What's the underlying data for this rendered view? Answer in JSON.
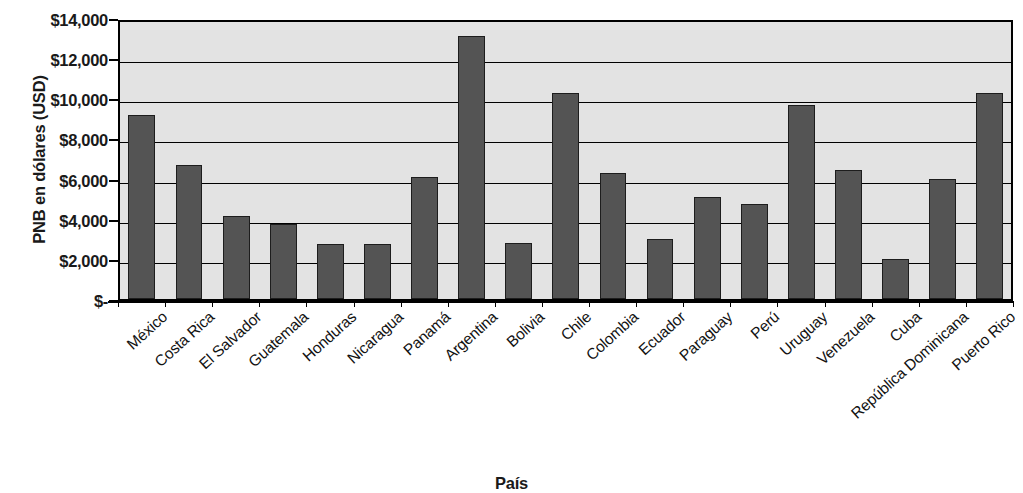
{
  "chart_data": {
    "type": "bar",
    "title": "",
    "xlabel": "País",
    "ylabel": "PNB en dólares (USD)",
    "ylim": [
      0,
      14000
    ],
    "ytick_values": [
      14000,
      12000,
      10000,
      8000,
      6000,
      4000,
      2000,
      0
    ],
    "ytick_labels": [
      "$14,000",
      "$12,000",
      "$10,000",
      "$8,000",
      "$6,000",
      "$4,000",
      "$2,000",
      "$-"
    ],
    "grid": true,
    "legend": "none",
    "bar_color": "#545454",
    "plot_background": "#e3e3e3",
    "categories": [
      "México",
      "Costa Rica",
      "El Salvador",
      "Guatemala",
      "Honduras",
      "Nicaragua",
      "Panamá",
      "Argentina",
      "Bolivia",
      "Chile",
      "Colombia",
      "Ecuador",
      "Paraguay",
      "Perú",
      "Uruguay",
      "Venezuela",
      "Cuba",
      "República Dominicana",
      "Puerto Rico"
    ],
    "values": [
      9150,
      6700,
      4150,
      3750,
      2750,
      2750,
      6100,
      13100,
      2800,
      10250,
      6300,
      3000,
      5100,
      4750,
      9650,
      6450,
      2000,
      5980,
      10250
    ]
  }
}
